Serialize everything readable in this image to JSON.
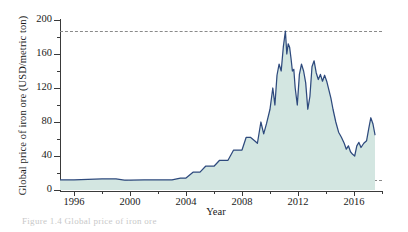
{
  "chart_data": {
    "type": "area",
    "title": "",
    "xlabel": "Year",
    "ylabel": "Global price of iron ore (USD/metric ton)",
    "xlim": [
      1995.0,
      2018.0
    ],
    "ylim": [
      0,
      200
    ],
    "grid": false,
    "legend": null,
    "y_ticks_major": [
      0,
      40,
      80,
      120,
      160,
      200
    ],
    "y_ticks_minor": [
      20,
      60,
      100,
      140,
      180
    ],
    "y_tick_labels": [
      "0",
      "40",
      "80",
      "120",
      "160",
      "200"
    ],
    "x_ticks_major": [
      1996,
      2000,
      2004,
      2008,
      2012,
      2016
    ],
    "x_ticks_minor": [
      1998,
      2002,
      2006,
      2010,
      2014,
      2018
    ],
    "x_tick_labels": [
      "1996",
      "2000",
      "2004",
      "2008",
      "2012",
      "2016"
    ],
    "line_color": "#2e4a7d",
    "fill_color": "#d3e6e1",
    "reference_lines": [
      {
        "name": "peak-reference",
        "y": 187,
        "style": "dashed",
        "color": "#8a8a8a"
      },
      {
        "name": "baseline-reference",
        "y": 12,
        "style": "dashed",
        "color": "#8a8a8a"
      }
    ],
    "series": [
      {
        "name": "Global price of iron ore",
        "x": [
          1995.0,
          1996.0,
          1997.0,
          1998.0,
          1999.0,
          1999.6,
          2000.0,
          2001.0,
          2002.0,
          2003.0,
          2003.6,
          2004.0,
          2004.5,
          2005.0,
          2005.4,
          2006.0,
          2006.4,
          2007.0,
          2007.4,
          2008.0,
          2008.3,
          2008.6,
          2008.9,
          2009.1,
          2009.35,
          2009.55,
          2009.75,
          2010.0,
          2010.2,
          2010.35,
          2010.5,
          2010.65,
          2010.8,
          2010.95,
          2011.1,
          2011.2,
          2011.3,
          2011.4,
          2011.5,
          2011.6,
          2011.7,
          2011.8,
          2011.95,
          2012.1,
          2012.25,
          2012.4,
          2012.55,
          2012.7,
          2012.85,
          2013.0,
          2013.15,
          2013.3,
          2013.45,
          2013.6,
          2013.75,
          2013.9,
          2014.05,
          2014.2,
          2014.35,
          2014.5,
          2014.7,
          2014.9,
          2015.1,
          2015.3,
          2015.45,
          2015.6,
          2015.75,
          2015.9,
          2016.05,
          2016.2,
          2016.35,
          2016.5,
          2016.7,
          2016.9,
          2017.05,
          2017.2,
          2017.35,
          2017.5
        ],
        "y": [
          12,
          12,
          12.5,
          13,
          13,
          11.5,
          11.5,
          12,
          12,
          12,
          14,
          14,
          21,
          21,
          28,
          28,
          35,
          35,
          47,
          47,
          62,
          62,
          58,
          55,
          80,
          66,
          78,
          95,
          120,
          100,
          135,
          148,
          140,
          168,
          187,
          160,
          172,
          168,
          155,
          140,
          142,
          120,
          100,
          136,
          148,
          140,
          126,
          95,
          110,
          145,
          152,
          138,
          130,
          136,
          128,
          135,
          128,
          118,
          108,
          95,
          80,
          68,
          62,
          55,
          48,
          52,
          45,
          42,
          40,
          52,
          56,
          50,
          55,
          58,
          72,
          85,
          78,
          65
        ]
      }
    ]
  },
  "caption": {
    "fragment": "Figure 1.4  Global price of iron ore"
  }
}
